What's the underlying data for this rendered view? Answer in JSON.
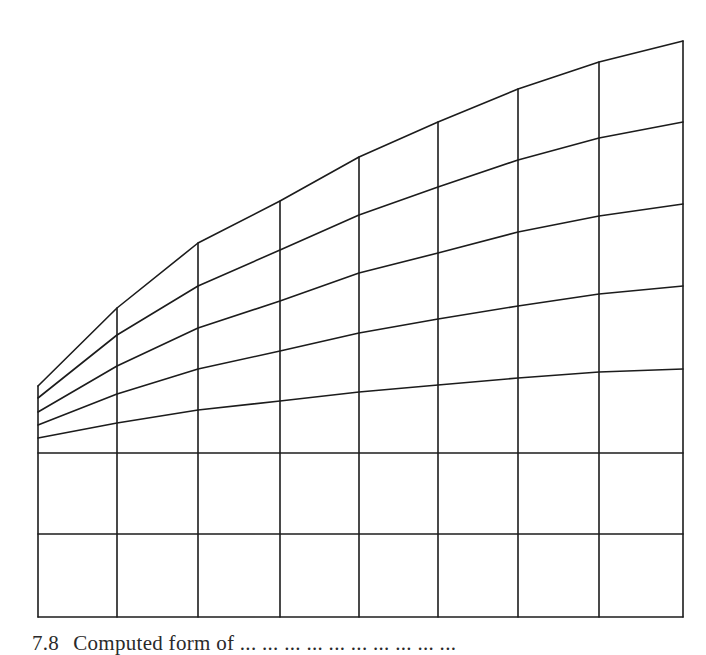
{
  "figure": {
    "type": "computed-mesh-grid",
    "stroke_color": "#1c1c1c",
    "background": "#ffffff",
    "columns_x": [
      38,
      117,
      198,
      280,
      359,
      438,
      518,
      599,
      683
    ],
    "bottom_rows_y": [
      453,
      534,
      617
    ],
    "curves": [
      {
        "name": "curve-1-top-boundary",
        "y": [
          386,
          308,
          243,
          201,
          157,
          122,
          89,
          62,
          41
        ]
      },
      {
        "name": "curve-2",
        "y": [
          398,
          335,
          286,
          250,
          215,
          187,
          160,
          138,
          122
        ]
      },
      {
        "name": "curve-3",
        "y": [
          412,
          366,
          328,
          301,
          273,
          253,
          232,
          216,
          204
        ]
      },
      {
        "name": "curve-4",
        "y": [
          425,
          394,
          369,
          351,
          333,
          319,
          306,
          294,
          286
        ]
      },
      {
        "name": "curve-5",
        "y": [
          438,
          423,
          410,
          401,
          392,
          385,
          378,
          372,
          369
        ]
      }
    ]
  },
  "caption": {
    "number": "7.8",
    "text": "Computed form of ... ... ... ... ... ... ... ... ... ..."
  }
}
